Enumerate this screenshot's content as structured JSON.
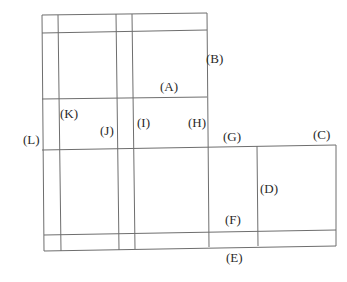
{
  "diagram": {
    "type": "floor-plan-grid",
    "line_color": "#6e6e6e",
    "labels": [
      {
        "id": "A",
        "text": "(A)",
        "x": 160,
        "y": 80
      },
      {
        "id": "B",
        "text": "(B)",
        "x": 206,
        "y": 52
      },
      {
        "id": "C",
        "text": "(C)",
        "x": 313,
        "y": 128
      },
      {
        "id": "D",
        "text": "(D)",
        "x": 260,
        "y": 182
      },
      {
        "id": "E",
        "text": "(E)",
        "x": 226,
        "y": 251
      },
      {
        "id": "F",
        "text": "(F)",
        "x": 225,
        "y": 213
      },
      {
        "id": "G",
        "text": "(G)",
        "x": 223,
        "y": 130
      },
      {
        "id": "H",
        "text": "(H)",
        "x": 188,
        "y": 116
      },
      {
        "id": "I",
        "text": "(I)",
        "x": 137,
        "y": 116
      },
      {
        "id": "J",
        "text": "(J)",
        "x": 100,
        "y": 124
      },
      {
        "id": "K",
        "text": "(K)",
        "x": 60,
        "y": 107
      },
      {
        "id": "L",
        "text": "(L)",
        "x": 23,
        "y": 133
      }
    ],
    "lines": [
      {
        "x1": 42,
        "y1": 15,
        "x2": 207,
        "y2": 13
      },
      {
        "x1": 42,
        "y1": 33,
        "x2": 207,
        "y2": 30
      },
      {
        "x1": 42,
        "y1": 99,
        "x2": 207,
        "y2": 97
      },
      {
        "x1": 42,
        "y1": 150,
        "x2": 336,
        "y2": 145
      },
      {
        "x1": 44,
        "y1": 235,
        "x2": 336,
        "y2": 230
      },
      {
        "x1": 44,
        "y1": 251,
        "x2": 336,
        "y2": 246
      },
      {
        "x1": 42,
        "y1": 15,
        "x2": 44,
        "y2": 251
      },
      {
        "x1": 58,
        "y1": 15,
        "x2": 61,
        "y2": 251
      },
      {
        "x1": 116,
        "y1": 14,
        "x2": 119,
        "y2": 250
      },
      {
        "x1": 132,
        "y1": 14,
        "x2": 135,
        "y2": 249
      },
      {
        "x1": 207,
        "y1": 13,
        "x2": 209,
        "y2": 247
      },
      {
        "x1": 257,
        "y1": 146,
        "x2": 258,
        "y2": 246
      },
      {
        "x1": 336,
        "y1": 145,
        "x2": 336,
        "y2": 246
      }
    ]
  }
}
